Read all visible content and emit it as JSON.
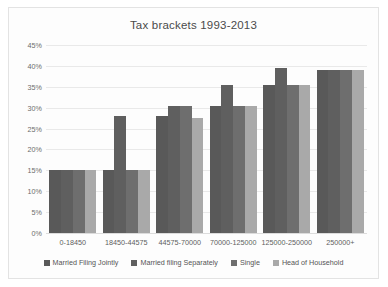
{
  "chart_data": {
    "type": "bar",
    "title": "Tax brackets 1993-2013",
    "xlabel": "",
    "ylabel": "",
    "ylim": [
      0,
      45
    ],
    "yticks": [
      "0%",
      "5%",
      "10%",
      "15%",
      "20%",
      "25%",
      "30%",
      "35%",
      "40%",
      "45%"
    ],
    "ytick_values": [
      0,
      5,
      10,
      15,
      20,
      25,
      30,
      35,
      40,
      45
    ],
    "grid": true,
    "legend_position": "bottom",
    "categories": [
      "0-18450",
      "18450-44575",
      "44575-70000",
      "70000-125000",
      "125000-250000",
      "250000+"
    ],
    "series": [
      {
        "name": "Married Filing Jointly",
        "color": "#595959",
        "values": [
          15,
          15,
          28,
          30.5,
          35.5,
          39
        ]
      },
      {
        "name": "Married filing Separately",
        "color": "#5f5f5f",
        "values": [
          15,
          28,
          30.5,
          35.5,
          39.5,
          39
        ]
      },
      {
        "name": "Single",
        "color": "#6e6e6e",
        "values": [
          15,
          15,
          30.5,
          30.5,
          35.5,
          39
        ]
      },
      {
        "name": "Head of Household",
        "color": "#a9a9a9",
        "values": [
          15,
          15,
          27.5,
          30.5,
          35.5,
          39
        ]
      }
    ]
  }
}
